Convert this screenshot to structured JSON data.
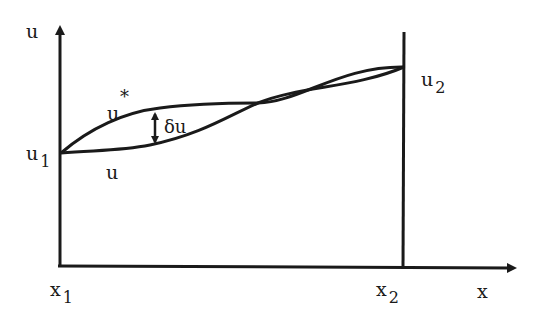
{
  "diagram": {
    "type": "function-variation-plot",
    "axes": {
      "y_label": "u",
      "x_label": "x"
    },
    "points": {
      "left": {
        "x_label": "x",
        "x_sub": "1",
        "u_label": "u",
        "u_sub": "1"
      },
      "right": {
        "x_label": "x",
        "x_sub": "2",
        "u_label": "u",
        "u_sub": "2"
      }
    },
    "curves": {
      "trial": {
        "label": "u",
        "marker": "*"
      },
      "exact": {
        "label": "u"
      }
    },
    "variation": {
      "label": "δu"
    },
    "colors": {
      "ink": "#1a1a1a",
      "background": "#ffffff"
    }
  }
}
